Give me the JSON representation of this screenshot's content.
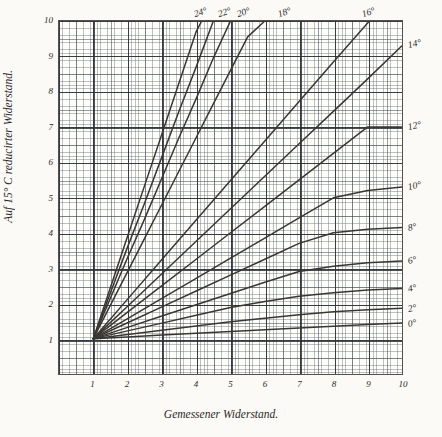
{
  "chart_data": {
    "type": "line",
    "title": "",
    "xlabel": "Gemessener Widerstand.",
    "ylabel": "Auf 15° C reducirter Widerstand.",
    "xlim": [
      0,
      10
    ],
    "ylim": [
      0,
      10
    ],
    "xticks": [
      "1",
      "2",
      "3",
      "4",
      "5",
      "6",
      "7",
      "8",
      "9",
      "10"
    ],
    "xtick_values": [
      1,
      2,
      3,
      4,
      5,
      6,
      7,
      8,
      9,
      10
    ],
    "yticks": [
      "1",
      "2",
      "3",
      "4",
      "5",
      "6",
      "7",
      "8",
      "9",
      "10"
    ],
    "ytick_values": [
      1,
      2,
      3,
      4,
      5,
      6,
      7,
      8,
      9,
      10
    ],
    "grid": true,
    "grid_minor_divisions": 10,
    "legend": "inline-curve-end-labels",
    "line_color": "#3a3733",
    "series": [
      {
        "name": "24°",
        "label": "24°",
        "label_side": "top",
        "x": [
          1,
          1.5,
          2,
          2.5,
          3,
          3.5,
          4,
          4.16
        ],
        "values": [
          1,
          2.45,
          3.9,
          5.35,
          6.8,
          8.25,
          9.7,
          10.0
        ]
      },
      {
        "name": "22°",
        "label": "22°",
        "label_side": "top",
        "x": [
          1,
          1.5,
          2,
          2.5,
          3,
          3.5,
          4,
          4.5,
          4.88
        ],
        "values": [
          1,
          2.3,
          3.6,
          4.85,
          6.15,
          7.45,
          8.7,
          10.0,
          10.0
        ]
      },
      {
        "name": "20°",
        "label": "20°",
        "label_side": "top",
        "x": [
          1,
          1.5,
          2,
          2.5,
          3,
          3.5,
          4,
          4.5,
          5,
          5.42
        ],
        "values": [
          1,
          2.15,
          3.3,
          4.4,
          5.55,
          6.7,
          7.8,
          8.95,
          10.0,
          10.0
        ]
      },
      {
        "name": "18°",
        "label": "18°",
        "label_side": "top",
        "x": [
          1,
          1.5,
          2,
          2.5,
          3,
          3.5,
          4,
          4.5,
          5,
          5.5,
          6,
          6.6
        ],
        "values": [
          1,
          1.95,
          2.9,
          3.85,
          4.8,
          5.75,
          6.7,
          7.65,
          8.6,
          9.55,
          10.0,
          10.0
        ]
      },
      {
        "name": "16°",
        "label": "16°",
        "label_side": "top",
        "x": [
          1,
          2,
          3,
          4,
          5,
          6,
          7,
          8,
          9.05
        ],
        "values": [
          1,
          2.12,
          3.24,
          4.36,
          5.48,
          6.6,
          7.72,
          8.84,
          10.0
        ]
      },
      {
        "name": "14°",
        "label": "14°",
        "label_side": "right",
        "x": [
          1,
          2,
          3,
          4,
          5,
          6,
          7,
          8,
          9,
          10
        ],
        "values": [
          1,
          1.92,
          2.84,
          3.76,
          4.68,
          5.6,
          6.52,
          7.44,
          8.36,
          9.3
        ]
      },
      {
        "name": "12°",
        "label": "12°",
        "label_side": "right",
        "x": [
          1,
          2,
          3,
          4,
          5,
          6,
          7,
          8,
          9,
          10
        ],
        "values": [
          1,
          1.75,
          2.5,
          3.25,
          4.0,
          4.75,
          5.5,
          6.25,
          7.0,
          7.0
        ]
      },
      {
        "name": "10°",
        "label": "10°",
        "label_side": "right",
        "x": [
          1,
          2,
          3,
          4,
          5,
          6,
          7,
          8,
          9,
          10
        ],
        "values": [
          1,
          1.57,
          2.14,
          2.71,
          3.28,
          3.85,
          4.42,
          4.99,
          5.2,
          5.3
        ]
      },
      {
        "name": "8°",
        "label": "8°",
        "label_side": "right",
        "x": [
          1,
          2,
          3,
          4,
          5,
          6,
          7,
          8,
          9,
          10
        ],
        "values": [
          1,
          1.45,
          1.9,
          2.35,
          2.8,
          3.25,
          3.7,
          4.0,
          4.1,
          4.15
        ]
      },
      {
        "name": "6°",
        "label": "6°",
        "label_side": "right",
        "x": [
          1,
          2,
          3,
          4,
          5,
          6,
          7,
          8,
          9,
          10
        ],
        "values": [
          1,
          1.32,
          1.64,
          1.96,
          2.28,
          2.6,
          2.9,
          3.05,
          3.15,
          3.2
        ]
      },
      {
        "name": "4°",
        "label": "4°",
        "label_side": "right",
        "x": [
          1,
          2,
          3,
          4,
          5,
          6,
          7,
          8,
          9,
          10
        ],
        "values": [
          1,
          1.22,
          1.44,
          1.66,
          1.88,
          2.05,
          2.2,
          2.3,
          2.38,
          2.42
        ]
      },
      {
        "name": "2°",
        "label": "2°",
        "label_side": "right",
        "x": [
          1,
          2,
          3,
          4,
          5,
          6,
          7,
          8,
          9,
          10
        ],
        "values": [
          1,
          1.12,
          1.24,
          1.36,
          1.48,
          1.58,
          1.68,
          1.76,
          1.82,
          1.86
        ]
      },
      {
        "name": "0°",
        "label": "0°",
        "label_side": "right",
        "x": [
          1,
          2,
          3,
          4,
          5,
          6,
          7,
          8,
          9,
          10
        ],
        "values": [
          1,
          1.05,
          1.1,
          1.15,
          1.2,
          1.25,
          1.3,
          1.35,
          1.4,
          1.44
        ]
      }
    ]
  }
}
